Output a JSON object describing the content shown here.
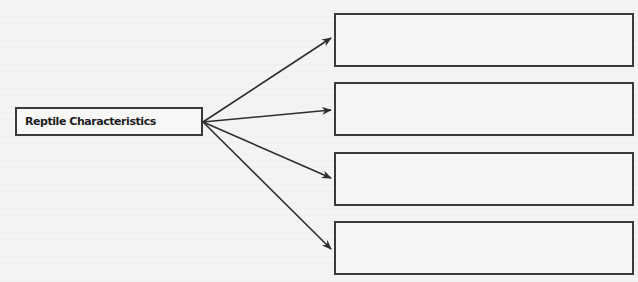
{
  "diagram": {
    "title": "Reptile Characteristics",
    "source_node": {
      "label": "Reptile Characteristics"
    },
    "target_nodes": [
      {
        "label": ""
      },
      {
        "label": ""
      },
      {
        "label": ""
      },
      {
        "label": ""
      }
    ],
    "edges": [
      {
        "from": "source",
        "to": "target-1"
      },
      {
        "from": "source",
        "to": "target-2"
      },
      {
        "from": "source",
        "to": "target-3"
      },
      {
        "from": "source",
        "to": "target-4"
      }
    ],
    "colors": {
      "stroke": "#3a3a3a",
      "text": "#1d1d1d",
      "paper": "#f4f4f2"
    }
  }
}
